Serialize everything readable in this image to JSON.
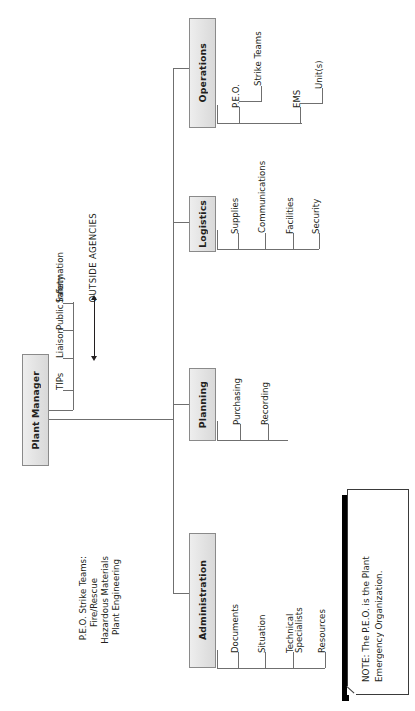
{
  "diagram": {
    "title_node": "Plant Manager",
    "orientation": "rotated-90-ccw",
    "root": {
      "label": "Plant Manager",
      "staff": [
        "TIPs",
        "Liaison",
        "Public Information",
        "Safety"
      ],
      "external_link": "OUTSIDE AGENCIES"
    },
    "sections": [
      {
        "label": "Operations",
        "children": [
          {
            "label": "P.E.O.",
            "children": [
              "Strike Teams"
            ]
          },
          {
            "label": "EMS",
            "children": [
              "Unit(s)"
            ]
          }
        ]
      },
      {
        "label": "Logistics",
        "children": [
          {
            "label": "Supplies",
            "children": []
          },
          {
            "label": "Communications",
            "children": []
          },
          {
            "label": "Facilities",
            "children": []
          },
          {
            "label": "Security",
            "children": []
          }
        ]
      },
      {
        "label": "Planning",
        "children": [
          {
            "label": "Purchasing",
            "children": []
          },
          {
            "label": "Recording",
            "children": []
          }
        ]
      },
      {
        "label": "Administration",
        "children": [
          {
            "label": "Documents",
            "children": []
          },
          {
            "label": "Situation",
            "children": []
          },
          {
            "label": "Technical\nSpecialists",
            "children": []
          },
          {
            "label": "Resources",
            "children": []
          }
        ]
      }
    ],
    "legend": {
      "heading": "P.E.O. Strike Teams:",
      "items": [
        "Fire/Rescue",
        "Hazardous Materials",
        "Plant Engineering"
      ]
    },
    "note": {
      "text": "NOTE: The P.E.O. is the Plant\nEmergency Organization."
    },
    "colors": {
      "box_fill": "#e6e6e6",
      "box_border": "#8a8a8a",
      "line": "#6f6f6f",
      "text": "#231f20",
      "note_shadow": "#000000",
      "page_bg": "#ffffff"
    }
  }
}
